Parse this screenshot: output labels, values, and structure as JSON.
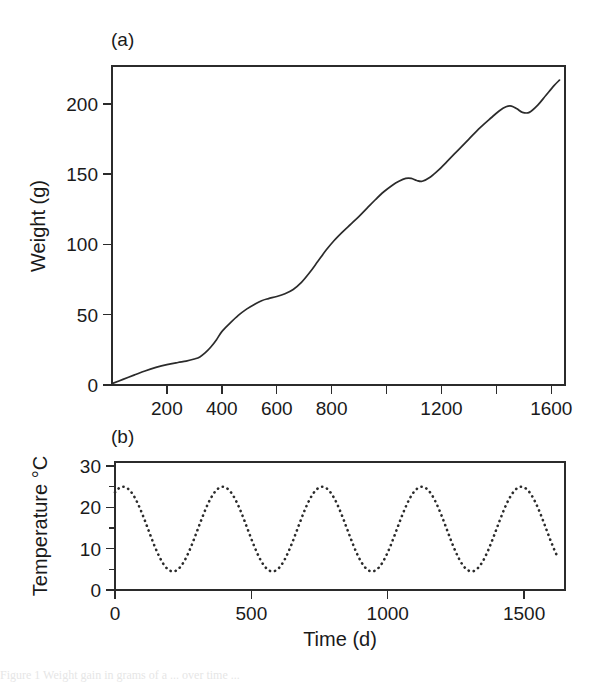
{
  "figure": {
    "panel_a_label": "(a)",
    "panel_b_label": "(b)",
    "caption_partial": "Figure 1  Weight gain in grams of a ... over time ..."
  },
  "chart_data": [
    {
      "type": "line",
      "panel": "(a)",
      "title": "",
      "xlabel": "",
      "ylabel": "Weight (g)",
      "xlim": [
        0,
        1650
      ],
      "ylim": [
        0,
        227
      ],
      "grid": false,
      "legend": "none",
      "linestyle": "solid",
      "xticks": [
        200,
        400,
        600,
        800,
        1000,
        1200,
        1400,
        1600
      ],
      "xticklabels": [
        "200",
        "400",
        "600",
        "800",
        "",
        "1200",
        "",
        "1600"
      ],
      "yticks": [
        0,
        50,
        100,
        150,
        200
      ],
      "yticklabels": [
        "0",
        "50",
        "100",
        "150",
        "200"
      ],
      "x": [
        0,
        40,
        80,
        120,
        160,
        200,
        240,
        270,
        300,
        320,
        340,
        360,
        380,
        400,
        430,
        460,
        490,
        520,
        545,
        570,
        600,
        630,
        660,
        690,
        720,
        750,
        780,
        810,
        840,
        870,
        900,
        930,
        960,
        990,
        1020,
        1045,
        1070,
        1090,
        1110,
        1130,
        1160,
        1190,
        1220,
        1260,
        1300,
        1340,
        1380,
        1410,
        1435,
        1455,
        1475,
        1495,
        1520,
        1550,
        1580,
        1610,
        1630
      ],
      "y": [
        1,
        4,
        7,
        10,
        12.5,
        14.5,
        16,
        17,
        18.5,
        20,
        23,
        27,
        32,
        38,
        44,
        49.5,
        54,
        57.5,
        60,
        61.5,
        63,
        65,
        68,
        73,
        80,
        88,
        96,
        103,
        109,
        114.5,
        120,
        126,
        132,
        137.5,
        142,
        145,
        147,
        147,
        145.5,
        145,
        148,
        153,
        159,
        167,
        175,
        183,
        190,
        195,
        198,
        198.5,
        196.5,
        194,
        194,
        199,
        206,
        213,
        217
      ]
    },
    {
      "type": "line",
      "panel": "(b)",
      "title": "",
      "xlabel": "Time (d)",
      "ylabel": "Temperature °C",
      "xlim": [
        0,
        1650
      ],
      "ylim": [
        0,
        31
      ],
      "grid": false,
      "legend": "none",
      "linestyle": "dotted",
      "xticks": [
        0,
        500,
        1000,
        1500
      ],
      "xticklabels": [
        "0",
        "500",
        "1000",
        "1500"
      ],
      "yticks": [
        0,
        10,
        20,
        30
      ],
      "yticklabels": [
        "0",
        "10",
        "20",
        "30"
      ],
      "yticks_minor": [
        5,
        15,
        25
      ],
      "seasonal": {
        "mean": 14.75,
        "amplitude": 10.25,
        "period_days": 365,
        "peak_day": 30,
        "min_value": 4.5,
        "max_value": 25.0
      }
    }
  ]
}
